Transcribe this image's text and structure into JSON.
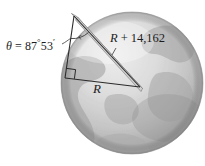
{
  "figure": {
    "background_color": "#ffffff",
    "width": 205,
    "height": 166,
    "globe": {
      "name": "earth-globe",
      "center_x": 132,
      "center_y": 83,
      "radius": 71,
      "ocean_light": "#e9e9e9",
      "ocean_mid": "#c9c9c9",
      "ocean_dark": "#9a9a9a",
      "land_color": "#b0b0b0",
      "edge_color": "#8e8e8e"
    },
    "triangle": {
      "name": "right-triangle",
      "stroke_color": "#2a2a2a",
      "apex": {
        "x": 74,
        "y": 16
      },
      "right_angle_vertex": {
        "x": 65,
        "y": 78
      },
      "base_vertex": {
        "x": 140,
        "y": 87
      },
      "right_angle_marker": true
    },
    "labels": {
      "theta": {
        "name": "angle-theta-label",
        "symbol": "θ",
        "equals": "=",
        "degrees": "87",
        "degree_mark": "°",
        "minutes": "53",
        "minute_mark": "′",
        "full_text": "θ = 87°53′"
      },
      "hypotenuse": {
        "name": "hypotenuse-label",
        "variable": "R",
        "operator": "+",
        "value": "14,162",
        "full_text": "R + 14,162"
      },
      "base": {
        "name": "base-label",
        "variable": "R",
        "full_text": "R"
      }
    }
  }
}
